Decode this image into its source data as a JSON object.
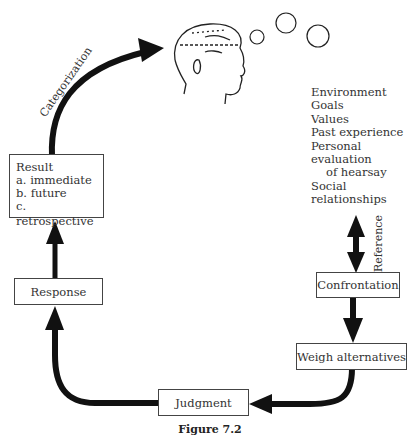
{
  "diagram": {
    "caption": "Figure 7.2",
    "nodes": {
      "result": {
        "title": "Result",
        "items": [
          "a. immediate",
          "b. future",
          "c. retrospective"
        ]
      },
      "response": {
        "label": "Response"
      },
      "judgment": {
        "label": "Judgment"
      },
      "weigh_alternatives": {
        "label": "Weigh alternatives"
      },
      "confrontation": {
        "label": "Confrontation"
      }
    },
    "edge_labels": {
      "categorization": "Categorization",
      "reference": "Reference"
    },
    "factors": {
      "items": [
        "Environment",
        "Goals",
        "Values",
        "Past experience",
        "Personal evaluation"
      ],
      "indented": "of hearsay",
      "last": "Social relationships"
    },
    "icons": [
      "head-profile-icon",
      "thought-bubble-icon"
    ]
  }
}
